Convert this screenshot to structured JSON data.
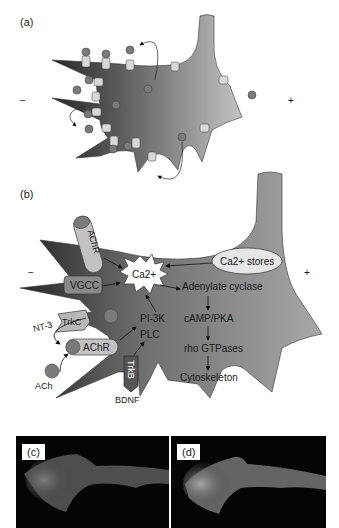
{
  "panels": {
    "a": {
      "label": "(a)",
      "minus": "−",
      "plus": "+"
    },
    "b": {
      "label": "(b)",
      "minus": "−",
      "plus": "+",
      "molecules": {
        "achr_top": "AChR",
        "vgcc": "VGCC",
        "ca": "Ca2+",
        "ca_stores": "Ca2+ stores",
        "trkc": "TrkC",
        "nt3": "NT-3",
        "achr_bottom": "AChR",
        "ach": "ACh",
        "trkb": "TrkB",
        "bdnf": "BDNF",
        "pi3k": "PI-3K",
        "plc": "PLC"
      },
      "cascade": [
        "Adenylate cyclase",
        "cAMP/PKA",
        "rho GTPases",
        "Cytoskeleton"
      ]
    },
    "c": {
      "label": "(c)"
    },
    "d": {
      "label": "(d)"
    }
  },
  "colors": {
    "cone_dark": "#2e2e2e",
    "cone_light": "#b8b8b8",
    "ligand": "#7a7a7a",
    "channel": "#d9d9d9",
    "vgcc": "#8a8a8a",
    "micro_bg": "#050505"
  }
}
